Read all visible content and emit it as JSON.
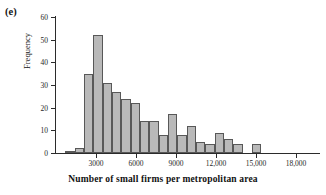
{
  "panel": {
    "label": "(e)"
  },
  "colors": {
    "bar_fill": "#b9b9b9",
    "bar_border": "#585858",
    "axis": "#2b2b2b",
    "text": "#141414",
    "background": "#ffffff"
  },
  "chart_data": {
    "type": "bar",
    "title": "",
    "subtitle": "",
    "xlabel": "Number of small firms per metropolitan area",
    "ylabel": "Frequency",
    "xlim": [
      0,
      19800
    ],
    "ylim": [
      0,
      60
    ],
    "grid": false,
    "legend": null,
    "bin_width": 1000,
    "x_tick_values": [
      3000,
      6000,
      9000,
      12000,
      15000,
      18000
    ],
    "x_tick_labels": [
      "3000",
      "6000",
      "9000",
      "12,000",
      "15,000",
      "18,000"
    ],
    "y_tick_values": [
      0,
      10,
      20,
      30,
      40,
      50,
      60
    ],
    "y_tick_labels": [
      "0",
      "10",
      "20",
      "30",
      "40",
      "50",
      "60"
    ],
    "bins": [
      {
        "left": 700,
        "right": 1400,
        "value": 1
      },
      {
        "left": 1400,
        "right": 2100,
        "value": 2
      },
      {
        "left": 2100,
        "right": 2800,
        "value": 35
      },
      {
        "left": 2800,
        "right": 3500,
        "value": 52
      },
      {
        "left": 3500,
        "right": 4200,
        "value": 31
      },
      {
        "left": 4200,
        "right": 4900,
        "value": 27
      },
      {
        "left": 4900,
        "right": 5600,
        "value": 24
      },
      {
        "left": 5600,
        "right": 6300,
        "value": 22
      },
      {
        "left": 6300,
        "right": 7000,
        "value": 14
      },
      {
        "left": 7000,
        "right": 7700,
        "value": 14
      },
      {
        "left": 7700,
        "right": 8400,
        "value": 8
      },
      {
        "left": 8400,
        "right": 9100,
        "value": 17
      },
      {
        "left": 9100,
        "right": 9800,
        "value": 8
      },
      {
        "left": 9800,
        "right": 10500,
        "value": 12
      },
      {
        "left": 10500,
        "right": 11200,
        "value": 5
      },
      {
        "left": 11200,
        "right": 11900,
        "value": 4
      },
      {
        "left": 11900,
        "right": 12600,
        "value": 9
      },
      {
        "left": 12600,
        "right": 13300,
        "value": 6
      },
      {
        "left": 13300,
        "right": 14000,
        "value": 4
      },
      {
        "left": 14000,
        "right": 14700,
        "value": 0
      },
      {
        "left": 14700,
        "right": 15400,
        "value": 4
      }
    ],
    "categories": [
      "700-1400",
      "1400-2100",
      "2100-2800",
      "2800-3500",
      "3500-4200",
      "4200-4900",
      "4900-5600",
      "5600-6300",
      "6300-7000",
      "7000-7700",
      "7700-8400",
      "8400-9100",
      "9100-9800",
      "9800-10500",
      "10500-11200",
      "11200-11900",
      "11900-12600",
      "12600-13300",
      "13300-14000",
      "14000-14700",
      "14700-15400"
    ],
    "values": [
      1,
      2,
      35,
      52,
      31,
      27,
      24,
      22,
      14,
      14,
      8,
      17,
      8,
      12,
      5,
      4,
      9,
      6,
      4,
      0,
      4
    ]
  }
}
